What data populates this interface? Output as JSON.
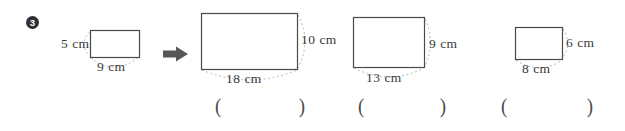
{
  "question": {
    "number": "3"
  },
  "source_figure": {
    "height_label": "5 cm",
    "width_label": "9 cm"
  },
  "figures": [
    {
      "height_label": "10 cm",
      "width_label": "18 cm"
    },
    {
      "height_label": "9 cm",
      "width_label": "13 cm"
    },
    {
      "height_label": "6 cm",
      "width_label": "8 cm"
    }
  ],
  "answer_blank": {
    "open": "(",
    "close": ")"
  },
  "colors": {
    "paper": "#ffffff",
    "line": "#4a4a4a",
    "text": "#3a3a3a",
    "dash": "#b5b5b5",
    "arrow": "#57575a",
    "badge_bg": "#2f2f31",
    "badge_text": "#ffffff"
  }
}
